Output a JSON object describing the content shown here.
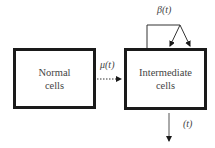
{
  "diagram": {
    "nodes": [
      {
        "id": "normal",
        "lines": [
          "Normal",
          "cells"
        ]
      },
      {
        "id": "intermediate",
        "lines": [
          "Intermediate",
          "cells"
        ]
      }
    ],
    "edges": {
      "transition": {
        "from": "normal",
        "to": "intermediate",
        "label": "μ(t)",
        "style": "dashed"
      },
      "proliferation": {
        "from": "intermediate",
        "to": "intermediate",
        "label": "β(t)",
        "style": "solid"
      },
      "death": {
        "from": "intermediate",
        "to": "out",
        "label": "(t)",
        "style": "solid"
      }
    }
  }
}
